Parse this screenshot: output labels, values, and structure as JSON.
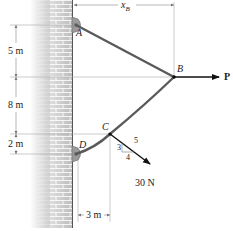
{
  "figure": {
    "points": {
      "A": "A",
      "B": "B",
      "C": "C",
      "D": "D"
    },
    "dimensions": {
      "AB_vertical": "5 m",
      "BC_vertical": "8 m",
      "CD_vertical": "2 m",
      "D_to_C_horizontal": "3 m",
      "x_B_label": "x",
      "x_B_subscript": "B"
    },
    "loads": {
      "P_label": "P",
      "force_C": "30 N",
      "slope_rise": "3",
      "slope_run": "4",
      "slope_hyp": "5"
    },
    "colors": {
      "cable": "#5a5a5a",
      "wall_brick": "#c8c8c8",
      "dimension_line": "#9a9a9a",
      "arrow": "#111111"
    }
  }
}
